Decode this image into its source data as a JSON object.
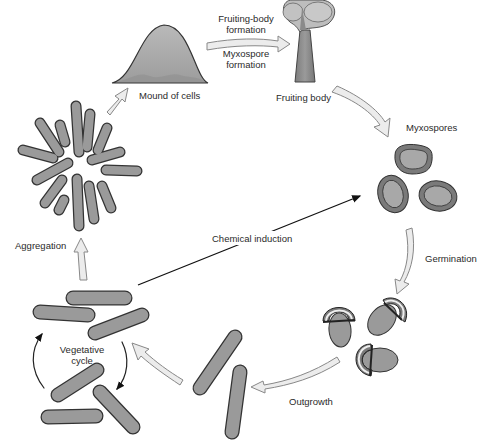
{
  "colors": {
    "cell_fill": "#9a9a9a",
    "cell_stroke": "#3a3a3a",
    "arrow_fill": "#ececec",
    "arrow_stroke": "#8a8a8a",
    "spore_outer": "#7a7a7a",
    "spore_inner": "#a6a6a6"
  },
  "labels": {
    "fruiting_body_formation": "Fruiting-body\nformation",
    "fruiting_body_formation_l1": "Fruiting-body",
    "fruiting_body_formation_l2": "formation",
    "myxospore_formation_l1": "Myxospore",
    "myxospore_formation_l2": "formation",
    "mound_of_cells": "Mound of cells",
    "fruiting_body": "Fruiting body",
    "myxospores": "Myxospores",
    "germination": "Germination",
    "outgrowth": "Outgrowth",
    "chemical_induction": "Chemical induction",
    "aggregation": "Aggregation",
    "vegetative_cycle_l1": "Vegetative",
    "vegetative_cycle_l2": "cycle"
  },
  "stages": [
    {
      "name": "Vegetative cycle"
    },
    {
      "name": "Aggregation"
    },
    {
      "name": "Mound of cells"
    },
    {
      "name": "Fruiting body"
    },
    {
      "name": "Myxospores"
    },
    {
      "name": "Germination"
    },
    {
      "name": "Outgrowth"
    }
  ]
}
